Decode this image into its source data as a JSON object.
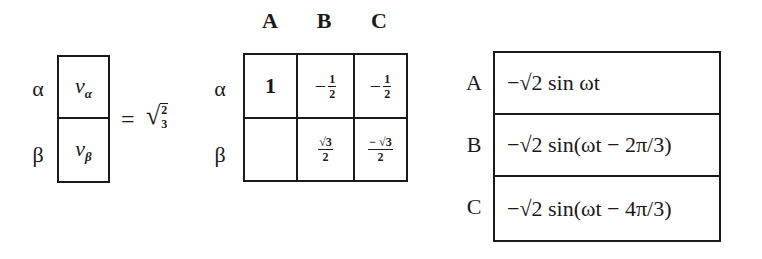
{
  "vector": {
    "row_labels": [
      "α",
      "β"
    ],
    "entries": [
      {
        "symbol": "v",
        "subscript": "α"
      },
      {
        "symbol": "v",
        "subscript": "β"
      }
    ]
  },
  "equation": {
    "equals": "=",
    "coefficient_radical": "√",
    "coefficient_num": "2",
    "coefficient_den": "3"
  },
  "matrix": {
    "column_labels": [
      "A",
      "B",
      "C"
    ],
    "row_labels": [
      "α",
      "β"
    ],
    "rows": [
      [
        {
          "kind": "number",
          "value": "1"
        },
        {
          "kind": "fraction",
          "sign": "−",
          "num": "1",
          "den": "2"
        },
        {
          "kind": "fraction",
          "sign": "−",
          "num": "1",
          "den": "2"
        }
      ],
      [
        {
          "kind": "empty",
          "value": ""
        },
        {
          "kind": "fraction",
          "sign": "",
          "num": "√3",
          "den": "2"
        },
        {
          "kind": "fraction",
          "sign": "",
          "num": "− √3",
          "den": "2"
        }
      ]
    ]
  },
  "phase_table": {
    "rows": [
      {
        "label": "A",
        "expression": "−√2 sin ωt"
      },
      {
        "label": "B",
        "expression": "−√2 sin(ωt − 2π/3)"
      },
      {
        "label": "C",
        "expression": "−√2 sin(ωt − 4π/3)"
      }
    ]
  }
}
